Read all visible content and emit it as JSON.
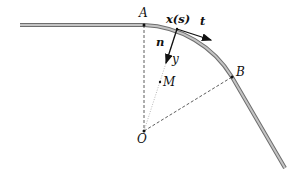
{
  "diagram": {
    "type": "curved-beam-geometry",
    "labels": {
      "A": "A",
      "B": "B",
      "O": "O",
      "M": "M",
      "xs": "x(s)",
      "t": "t",
      "n": "n",
      "y": "y"
    },
    "colors": {
      "beam": "#a8a8a8",
      "beam_edge": "#707070",
      "lines": "#333333",
      "text": "#111111"
    }
  }
}
